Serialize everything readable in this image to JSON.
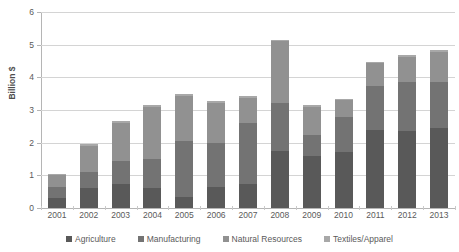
{
  "chart_data": {
    "type": "bar",
    "stacked": true,
    "title": "",
    "xlabel": "",
    "ylabel": "Billion $",
    "ylim": [
      0,
      6
    ],
    "yticks": [
      "0",
      "1",
      "2",
      "3",
      "4",
      "5",
      "6"
    ],
    "grid": true,
    "legend_position": "bottom",
    "categories": [
      "2001",
      "2002",
      "2003",
      "2004",
      "2005",
      "2006",
      "2007",
      "2008",
      "2009",
      "2010",
      "2011",
      "2012",
      "2013"
    ],
    "series": [
      {
        "name": "Agriculture",
        "color": "#595959",
        "values": [
          0.3,
          0.6,
          0.75,
          0.6,
          0.35,
          0.65,
          0.75,
          1.75,
          1.6,
          1.7,
          2.4,
          2.35,
          2.45
        ]
      },
      {
        "name": "Manufacturing",
        "color": "#737373",
        "values": [
          0.35,
          0.5,
          0.7,
          0.9,
          1.7,
          1.35,
          1.85,
          1.45,
          0.65,
          1.1,
          1.35,
          1.5,
          1.4
        ]
      },
      {
        "name": "Natural Resources",
        "color": "#919191",
        "values": [
          0.35,
          0.8,
          1.15,
          1.6,
          1.38,
          1.22,
          0.78,
          1.9,
          0.85,
          0.5,
          0.68,
          0.77,
          0.93
        ]
      },
      {
        "name": "Textiles/Apparel",
        "color": "#a8a8a8",
        "values": [
          0.05,
          0.05,
          0.05,
          0.05,
          0.05,
          0.05,
          0.05,
          0.05,
          0.05,
          0.05,
          0.05,
          0.05,
          0.05
        ]
      }
    ],
    "totals": [
      1.05,
      1.92,
      2.65,
      3.12,
      3.46,
      3.26,
      3.4,
      5.15,
      3.12,
      3.33,
      4.45,
      4.65,
      4.82
    ]
  },
  "axis": {
    "grid_color": "#d4d4d4",
    "line_color": "#b5b5b5"
  }
}
